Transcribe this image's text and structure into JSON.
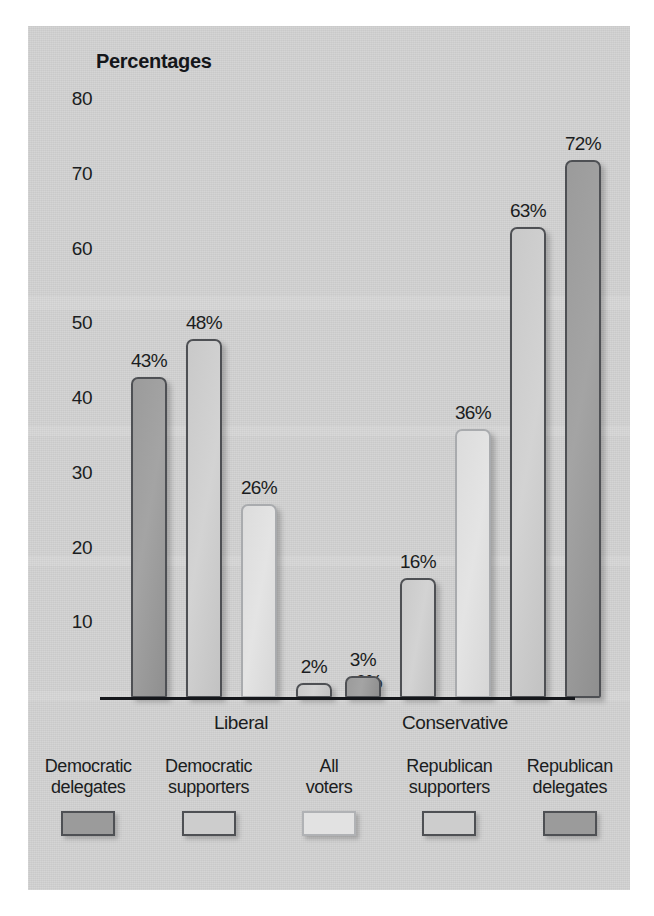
{
  "chart_data": {
    "type": "bar",
    "title": "Percentages",
    "xlabel": "",
    "ylabel": "",
    "ylim": [
      0,
      80
    ],
    "yticks": [
      80,
      70,
      60,
      50,
      40,
      30,
      20,
      10
    ],
    "grid": false,
    "legend_position": "bottom",
    "categories": [
      "Liberal",
      "Conservative"
    ],
    "series": [
      {
        "name": "Democratic delegates",
        "values": [
          43,
          3
        ],
        "style": "dark",
        "labels": [
          "43%",
          "3%"
        ]
      },
      {
        "name": "Democratic supporters",
        "values": [
          48,
          16
        ],
        "style": "mid",
        "labels": [
          "48%",
          "16%"
        ]
      },
      {
        "name": "All voters",
        "values": [
          26,
          36
        ],
        "style": "light",
        "labels": [
          "26%",
          "36%"
        ]
      },
      {
        "name": "Republican supporters",
        "values": [
          2,
          63
        ],
        "style": "mid",
        "labels": [
          "2%",
          "63%"
        ]
      },
      {
        "name": "Republican delegates",
        "values": [
          0,
          72
        ],
        "style": "dark",
        "labels": [
          "0%",
          "72%"
        ]
      }
    ]
  },
  "legend": {
    "items": [
      {
        "label": "Democratic\ndelegates",
        "swatch": "sw-dark"
      },
      {
        "label": "Democratic\nsupporters",
        "swatch": "sw-mid"
      },
      {
        "label": "All\nvoters",
        "swatch": "sw-light"
      },
      {
        "label": "Republican\nsupporters",
        "swatch": "sw-mid"
      },
      {
        "label": "Republican\ndelegates",
        "swatch": "sw-dark"
      }
    ]
  },
  "colors": {
    "panel_background": "#d2d2d2",
    "axis": "#15171b",
    "text": "#1b1d21",
    "bar_dark": "#9b9b9b",
    "bar_mid": "#cdcdcd",
    "bar_light": "#e2e2e2",
    "border_dark": "#4e5054",
    "border_light": "#a9abae"
  }
}
